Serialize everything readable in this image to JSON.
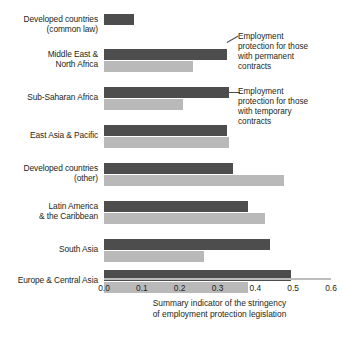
{
  "chart_data": {
    "type": "bar",
    "orientation": "horizontal",
    "title": "",
    "subtitle": "",
    "xlabel": "Summary indicator of the stringency\nof employment protection legislation",
    "ylabel": "",
    "xlim": [
      0.0,
      0.6
    ],
    "xticks": [
      "0.0",
      "0.1",
      "0.2",
      "0.3",
      "0.4",
      "0.5",
      "0.6"
    ],
    "xtick_values": [
      0.0,
      0.1,
      0.2,
      0.3,
      0.4,
      0.5,
      0.6
    ],
    "grid": false,
    "legend_position": "annotations-right",
    "categories": [
      "Developed countries\n(common law)",
      "Middle East &\nNorth Africa",
      "Sub-Saharan Africa",
      "East Asia & Pacific",
      "Developed countries\n(other)",
      "Latin America\n& the Caribbean",
      "South Asia",
      "Europe & Central Asia"
    ],
    "series": [
      {
        "name": "Employment protection for those with permanent contracts",
        "color": "#4d4d4d",
        "values": [
          0.08,
          0.325,
          0.33,
          0.325,
          0.34,
          0.38,
          0.44,
          0.495
        ]
      },
      {
        "name": "Employment protection for those with temporary contracts",
        "color": "#b9b9b9",
        "values": [
          0.0,
          0.235,
          0.21,
          0.33,
          0.475,
          0.425,
          0.265,
          0.38
        ]
      }
    ],
    "annotations": [
      {
        "id": "permanent",
        "text": "Employment\nprotection for those\nwith permanent\ncontracts"
      },
      {
        "id": "temporary",
        "text": "Employment\nprotection for those\nwith temporary\ncontracts"
      }
    ]
  },
  "colors": {
    "permanent": "#4d4d4d",
    "temporary": "#b9b9b9",
    "axis": "#bdbdbd",
    "text": "#231f20",
    "background": "#ffffff"
  }
}
